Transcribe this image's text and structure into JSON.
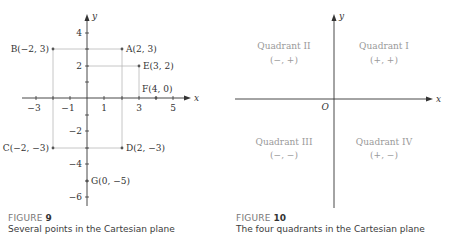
{
  "figure9": {
    "label": "FIGURE",
    "number": "9",
    "caption": "Several points in the Cartesian plane",
    "axes": {
      "x_label": "x",
      "y_label": "y"
    },
    "x_ticks": [
      {
        "value": -3,
        "label": "−3"
      },
      {
        "value": -1,
        "label": "−1"
      },
      {
        "value": 1,
        "label": "1"
      },
      {
        "value": 3,
        "label": "3"
      },
      {
        "value": 5,
        "label": "5"
      }
    ],
    "y_ticks": [
      {
        "value": 4,
        "label": "4"
      },
      {
        "value": 2,
        "label": "2"
      },
      {
        "value": -2,
        "label": "−2"
      },
      {
        "value": -4,
        "label": "−4"
      },
      {
        "value": -6,
        "label": "−6"
      }
    ],
    "points": [
      {
        "name": "A",
        "coords": "(2, 3)",
        "label": "A(2, 3)",
        "x": 2,
        "y": 3
      },
      {
        "name": "B",
        "coords": "(−2, 3)",
        "label": "B(−2, 3)",
        "x": -2,
        "y": 3
      },
      {
        "name": "E",
        "coords": "(3, 2)",
        "label": "E(3, 2)",
        "x": 3,
        "y": 2
      },
      {
        "name": "F",
        "coords": "(4, 0)",
        "label": "F(4, 0)",
        "x": 4,
        "y": 0
      },
      {
        "name": "C",
        "coords": "(−2, −3)",
        "label": "C(−2, −3)",
        "x": -2,
        "y": -3
      },
      {
        "name": "D",
        "coords": "(2, −3)",
        "label": "D(2, −3)",
        "x": 2,
        "y": -3
      },
      {
        "name": "G",
        "coords": "(0, −5)",
        "label": "G(0, −5)",
        "x": 0,
        "y": -5
      }
    ]
  },
  "figure10": {
    "label": "FIGURE",
    "number": "10",
    "caption": "The four quadrants in the Cartesian plane",
    "axes": {
      "x_label": "x",
      "y_label": "y",
      "origin_label": "O"
    },
    "quadrants": [
      {
        "name": "Quadrant II",
        "signs": "(−, +)"
      },
      {
        "name": "Quadrant I",
        "signs": "(+, +)"
      },
      {
        "name": "Quadrant III",
        "signs": "(−, −)"
      },
      {
        "name": "Quadrant IV",
        "signs": "(+, −)"
      }
    ]
  },
  "colors": {
    "axis": "#333333",
    "guide": "#b5b5b5",
    "quadrant_text": "#9a9a9a",
    "point": "#555555"
  }
}
